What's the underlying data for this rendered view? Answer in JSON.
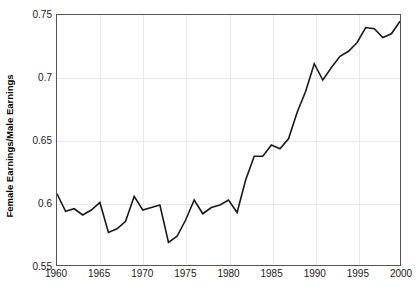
{
  "chart_data": {
    "type": "line",
    "title": "",
    "subtitle": "",
    "xlabel": "",
    "ylabel": "Female Earnings/Male Earnings",
    "xlim": [
      1960,
      2000
    ],
    "ylim": [
      0.55,
      0.75
    ],
    "grid": true,
    "legend": "none",
    "xticks": [
      "1960",
      "1965",
      "1970",
      "1975",
      "1980",
      "1985",
      "1990",
      "1995",
      "2000"
    ],
    "xtick_values": [
      1960,
      1965,
      1970,
      1975,
      1980,
      1985,
      1990,
      1995,
      2000
    ],
    "yticks": [
      "0.55",
      "0.6",
      "0.65",
      "0.7",
      "0.75"
    ],
    "ytick_values": [
      0.55,
      0.6,
      0.65,
      0.7,
      0.75
    ],
    "series": [
      {
        "name": "Female Earnings/Male Earnings",
        "color": "#1a1a1a",
        "x": [
          1960,
          1961,
          1962,
          1963,
          1964,
          1965,
          1966,
          1967,
          1968,
          1969,
          1970,
          1971,
          1972,
          1973,
          1974,
          1975,
          1976,
          1977,
          1978,
          1979,
          1980,
          1981,
          1982,
          1983,
          1984,
          1985,
          1986,
          1987,
          1988,
          1989,
          1990,
          1991,
          1992,
          1993,
          1994,
          1995,
          1996,
          1997,
          1998,
          1999,
          2000
        ],
        "values": [
          0.607,
          0.593,
          0.595,
          0.59,
          0.594,
          0.6,
          0.576,
          0.579,
          0.585,
          0.605,
          0.594,
          0.596,
          0.598,
          0.568,
          0.573,
          0.586,
          0.602,
          0.591,
          0.596,
          0.598,
          0.602,
          0.592,
          0.618,
          0.637,
          0.637,
          0.646,
          0.643,
          0.651,
          0.672,
          0.689,
          0.711,
          0.698,
          0.708,
          0.717,
          0.721,
          0.728,
          0.74,
          0.739,
          0.732,
          0.735,
          0.745
        ]
      }
    ]
  },
  "axis": {
    "y_title": "Female Earnings/Male Earnings"
  },
  "style": {
    "line_color": "#1a1a1a",
    "grid_color": "#e9e9e9",
    "frame_color": "#555555",
    "text_color": "#1a1a1a",
    "background": "#ffffff"
  }
}
